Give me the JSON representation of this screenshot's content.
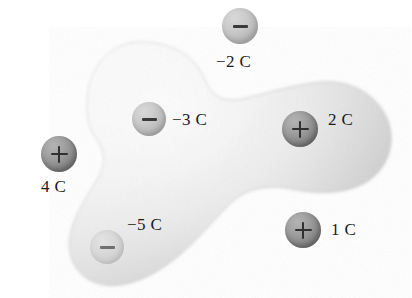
{
  "figure": {
    "background_color": "#ffffff",
    "width": 412,
    "height": 298,
    "surface": {
      "name": "gaussian-surface",
      "description": "irregular three-lobed shaded closed surface",
      "fill_light": "#f7f7f7",
      "fill_mid": "#e3e3e3",
      "fill_dark": "#c9c9c9",
      "edge_color": "#bdbdbd"
    },
    "charges": [
      {
        "id": "charge-minus-2c",
        "label": "−2 C",
        "value": -2,
        "unit": "C",
        "sign": "minus",
        "inside_surface": false,
        "sphere_color": "#bdbdbd",
        "cx": 240,
        "cy": 26,
        "r": 18,
        "label_x": 216,
        "label_y": 52
      },
      {
        "id": "charge-minus-3c",
        "label": "−3 C",
        "value": -3,
        "unit": "C",
        "sign": "minus",
        "inside_surface": true,
        "sphere_color": "#c6c6c6",
        "cx": 149,
        "cy": 119,
        "r": 17,
        "label_x": 172,
        "label_y": 110
      },
      {
        "id": "charge-plus-2c",
        "label": "2 C",
        "value": 2,
        "unit": "C",
        "sign": "plus",
        "inside_surface": true,
        "sphere_color": "#8d8d8d",
        "cx": 300,
        "cy": 129,
        "r": 18,
        "label_x": 328,
        "label_y": 110
      },
      {
        "id": "charge-plus-4c",
        "label": "4 C",
        "value": 4,
        "unit": "C",
        "sign": "plus",
        "inside_surface": false,
        "sphere_color": "#8d8d8d",
        "cx": 59,
        "cy": 154,
        "r": 18,
        "label_x": 41,
        "label_y": 177
      },
      {
        "id": "charge-minus-5c",
        "label": "−5 C",
        "value": -5,
        "unit": "C",
        "sign": "minus",
        "inside_surface": true,
        "sphere_color": "#d6d6d6",
        "cx": 107,
        "cy": 247,
        "r": 17,
        "label_x": 127,
        "label_y": 215
      },
      {
        "id": "charge-plus-1c",
        "label": "1 C",
        "value": 1,
        "unit": "C",
        "sign": "plus",
        "inside_surface": false,
        "sphere_color": "#8d8d8d",
        "cx": 303,
        "cy": 230,
        "r": 18,
        "label_x": 331,
        "label_y": 220
      }
    ]
  }
}
